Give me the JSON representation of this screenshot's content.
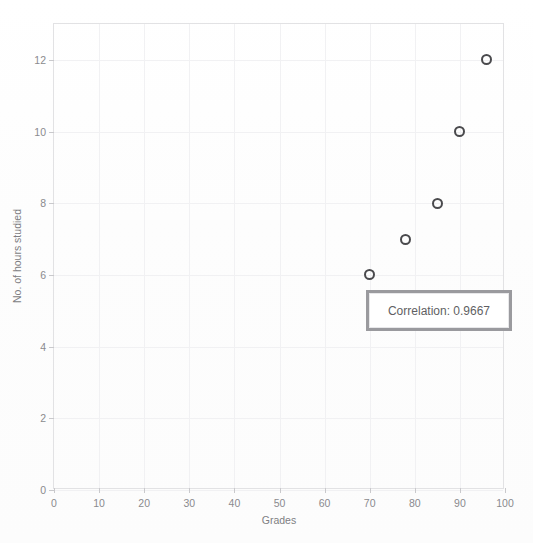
{
  "chart_data": {
    "type": "scatter",
    "title": "",
    "xlabel": "Grades",
    "ylabel": "No. of hours studied",
    "xlim": [
      0,
      100
    ],
    "ylim": [
      0,
      13
    ],
    "xticks": [
      0,
      10,
      20,
      30,
      40,
      50,
      60,
      70,
      80,
      90,
      100
    ],
    "yticks": [
      0,
      2,
      4,
      6,
      8,
      10,
      12
    ],
    "grid": true,
    "legend": null,
    "marker_style": "open-circle",
    "marker_color": "#4a4a4d",
    "points": [
      {
        "x": 70,
        "y": 6
      },
      {
        "x": 78,
        "y": 7
      },
      {
        "x": 85,
        "y": 8
      },
      {
        "x": 90,
        "y": 10
      },
      {
        "x": 96,
        "y": 12
      }
    ],
    "series": [
      {
        "name": "Hours studied vs Grades",
        "x": [
          70,
          78,
          85,
          90,
          96
        ],
        "values": [
          6,
          7,
          8,
          10,
          12
        ]
      }
    ],
    "annotations": [
      {
        "id": "correlation-box",
        "text": "Correlation: 0.9667",
        "value": 0.9667,
        "x": 81,
        "y": 4.8
      }
    ]
  },
  "axes": {
    "y_tick_labels": [
      "12",
      "10",
      "8",
      "6",
      "4",
      "2",
      "0"
    ],
    "x_tick_labels": [
      "0",
      "10",
      "20",
      "30",
      "40",
      "50",
      "60",
      "70",
      "80",
      "90",
      "100"
    ],
    "y_title": "No. of hours studied",
    "x_title": "Grades"
  },
  "annotation": {
    "correlation_text": "Correlation: 0.9667"
  },
  "title_remnant": {
    "text": ""
  },
  "colors": {
    "background": "#fefefe",
    "frame": "#e2e2e4",
    "gridline": "#f1f1f3",
    "tick_text": "#8a8a8e",
    "axis_title": "#7e7e82",
    "marker": "#4a4a4d",
    "annotation_border": "#9a9a9e",
    "annotation_text": "#5f5f63"
  }
}
